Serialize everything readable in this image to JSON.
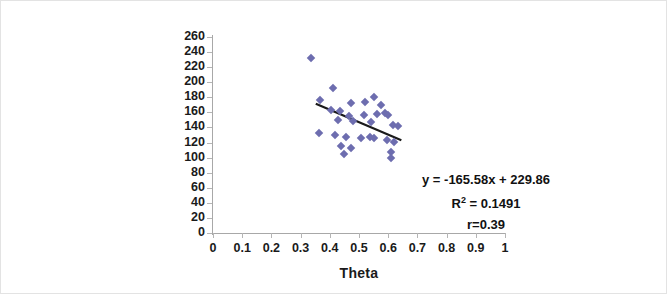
{
  "chart_data": {
    "type": "scatter",
    "title": "",
    "xlabel": "Theta",
    "ylabel": "Single Fiber Linear density(mtex)",
    "ylabel_lines": [
      "Single Fiber Linear",
      "density(mtex)"
    ],
    "xlim": [
      0,
      1
    ],
    "ylim": [
      0,
      260
    ],
    "xticks": [
      "0",
      "0.1",
      "0.2",
      "0.3",
      "0.4",
      "0.5",
      "0.6",
      "0.7",
      "0.8",
      "0.9",
      "1"
    ],
    "xtick_values": [
      0,
      0.1,
      0.2,
      0.3,
      0.4,
      0.5,
      0.6,
      0.7,
      0.8,
      0.9,
      1
    ],
    "yticks": [
      "260",
      "240",
      "220",
      "200",
      "180",
      "160",
      "140",
      "120",
      "100",
      "80",
      "60",
      "40",
      "20",
      "0"
    ],
    "ytick_values": [
      260,
      240,
      220,
      200,
      180,
      160,
      140,
      120,
      100,
      80,
      60,
      40,
      20,
      0
    ],
    "grid": false,
    "legend": null,
    "marker_color": "#6d6daf",
    "marker_shape": "diamond",
    "trendline_color": "#1a1a1a",
    "points": [
      {
        "x": 0.336,
        "y": 232
      },
      {
        "x": 0.411,
        "y": 192
      },
      {
        "x": 0.365,
        "y": 176
      },
      {
        "x": 0.474,
        "y": 172
      },
      {
        "x": 0.521,
        "y": 174
      },
      {
        "x": 0.552,
        "y": 181
      },
      {
        "x": 0.576,
        "y": 170
      },
      {
        "x": 0.404,
        "y": 163
      },
      {
        "x": 0.436,
        "y": 162
      },
      {
        "x": 0.466,
        "y": 155
      },
      {
        "x": 0.516,
        "y": 156
      },
      {
        "x": 0.56,
        "y": 158
      },
      {
        "x": 0.588,
        "y": 159
      },
      {
        "x": 0.6,
        "y": 157
      },
      {
        "x": 0.428,
        "y": 150
      },
      {
        "x": 0.478,
        "y": 148
      },
      {
        "x": 0.541,
        "y": 147
      },
      {
        "x": 0.618,
        "y": 143
      },
      {
        "x": 0.632,
        "y": 142
      },
      {
        "x": 0.362,
        "y": 133
      },
      {
        "x": 0.418,
        "y": 130
      },
      {
        "x": 0.455,
        "y": 128
      },
      {
        "x": 0.508,
        "y": 126
      },
      {
        "x": 0.539,
        "y": 127
      },
      {
        "x": 0.551,
        "y": 126
      },
      {
        "x": 0.596,
        "y": 124
      },
      {
        "x": 0.62,
        "y": 121
      },
      {
        "x": 0.44,
        "y": 115
      },
      {
        "x": 0.472,
        "y": 113
      },
      {
        "x": 0.608,
        "y": 108
      },
      {
        "x": 0.61,
        "y": 100
      },
      {
        "x": 0.447,
        "y": 105
      }
    ],
    "trendline": {
      "equation": "y = -165.58x + 229.86",
      "slope": -165.58,
      "intercept": 229.86,
      "x_start": 0.352,
      "x_end": 0.645
    },
    "annotations": {
      "equation": "y = -165.58x + 229.86",
      "r_squared_label": "R",
      "r_squared_exp": "2",
      "r_squared_value": "= 0.1491",
      "r_squared_full": "R2 = 0.1491",
      "correlation": "r=0.39"
    }
  }
}
